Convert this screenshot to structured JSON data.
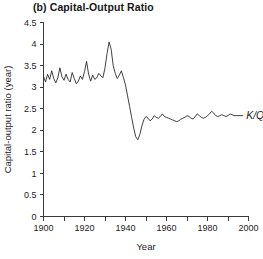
{
  "chart_data": {
    "type": "line",
    "title": "(b) Capital-Output Ratio",
    "xlabel": "Year",
    "ylabel": "Capital-output ratio (year)",
    "xlim": [
      1900,
      2000
    ],
    "ylim": [
      0,
      4.5
    ],
    "xticks": [
      1900,
      1920,
      1940,
      1960,
      1980,
      2000
    ],
    "xtick_labels": [
      "1900",
      "1920",
      "1940",
      "1960",
      "1980",
      "2000"
    ],
    "xminor_ticks": [
      1910,
      1930,
      1950,
      1970,
      1990
    ],
    "yticks": [
      0,
      0.5,
      1,
      1.5,
      2,
      2.5,
      3,
      3.5,
      4,
      4.5
    ],
    "ytick_labels": [
      "0",
      "0.5",
      "1",
      "1.5",
      "2",
      "2.5",
      "3",
      "3.5",
      "4",
      "4.5"
    ],
    "grid": false,
    "legend_position": "right-inline",
    "series": [
      {
        "name": "K/Q",
        "label": "K/Q",
        "color": "#2b2b2b",
        "x": [
          1900,
          1901,
          1902,
          1903,
          1904,
          1905,
          1906,
          1907,
          1908,
          1909,
          1910,
          1911,
          1912,
          1913,
          1914,
          1915,
          1916,
          1917,
          1918,
          1919,
          1920,
          1921,
          1922,
          1923,
          1924,
          1925,
          1926,
          1927,
          1928,
          1929,
          1930,
          1931,
          1932,
          1933,
          1934,
          1935,
          1936,
          1937,
          1938,
          1939,
          1940,
          1941,
          1942,
          1943,
          1944,
          1945,
          1946,
          1947,
          1948,
          1949,
          1950,
          1951,
          1952,
          1953,
          1954,
          1955,
          1956,
          1957,
          1958,
          1959,
          1960,
          1961,
          1962,
          1963,
          1964,
          1965,
          1966,
          1967,
          1968,
          1969,
          1970,
          1971,
          1972,
          1973,
          1974,
          1975,
          1976,
          1977,
          1978,
          1979,
          1980,
          1981,
          1982,
          1983,
          1984,
          1985,
          1986,
          1987,
          1988,
          1989,
          1990,
          1991,
          1992,
          1993
        ],
        "values": [
          3.25,
          3.12,
          3.3,
          3.18,
          3.38,
          3.2,
          3.1,
          3.22,
          3.45,
          3.24,
          3.16,
          3.3,
          3.18,
          3.12,
          3.34,
          3.2,
          3.08,
          3.14,
          3.26,
          3.18,
          3.36,
          3.6,
          3.3,
          3.14,
          3.28,
          3.18,
          3.22,
          3.32,
          3.26,
          3.22,
          3.45,
          3.78,
          4.05,
          3.88,
          3.5,
          3.32,
          3.2,
          3.28,
          3.38,
          3.22,
          3.05,
          2.8,
          2.55,
          2.3,
          2.05,
          1.85,
          1.78,
          1.9,
          2.1,
          2.25,
          2.32,
          2.28,
          2.22,
          2.26,
          2.34,
          2.3,
          2.28,
          2.32,
          2.38,
          2.32,
          2.3,
          2.28,
          2.26,
          2.24,
          2.22,
          2.2,
          2.22,
          2.26,
          2.28,
          2.3,
          2.34,
          2.32,
          2.28,
          2.26,
          2.32,
          2.38,
          2.34,
          2.3,
          2.28,
          2.3,
          2.34,
          2.38,
          2.44,
          2.4,
          2.34,
          2.32,
          2.34,
          2.36,
          2.34,
          2.32,
          2.34,
          2.38,
          2.36,
          2.34
        ]
      }
    ]
  }
}
